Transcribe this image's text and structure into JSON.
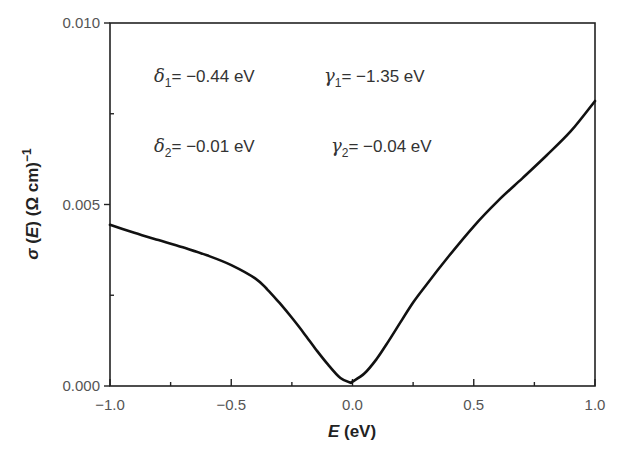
{
  "chart_data": {
    "type": "line",
    "title": "",
    "xlabel": "E (eV)",
    "ylabel": "σ (E) (Ω cm)⁻¹",
    "xlim": [
      -1.0,
      1.0
    ],
    "ylim": [
      0.0,
      0.01
    ],
    "x_ticks": [
      "-1.0",
      "-0.5",
      "0.0",
      "0.5",
      "1.0"
    ],
    "x_ticks_display": [
      "−1.0",
      "−0.5",
      "0.0",
      "0.5",
      "1.0"
    ],
    "y_ticks": [
      "0.000",
      "0.005",
      "0.010"
    ],
    "grid": false,
    "legend": null,
    "series": [
      {
        "name": "sigma(E)",
        "color": "#111111",
        "x": [
          -1.0,
          -0.9,
          -0.8,
          -0.7,
          -0.6,
          -0.5,
          -0.4,
          -0.35,
          -0.3,
          -0.25,
          -0.2,
          -0.15,
          -0.1,
          -0.05,
          -0.01,
          0.0,
          0.05,
          0.1,
          0.15,
          0.2,
          0.25,
          0.3,
          0.4,
          0.5,
          0.6,
          0.7,
          0.8,
          0.9,
          1.0
        ],
        "y": [
          0.00444,
          0.00422,
          0.00402,
          0.00382,
          0.0036,
          0.00333,
          0.00296,
          0.00265,
          0.00228,
          0.00188,
          0.00145,
          0.001,
          0.00058,
          0.00022,
          0.0001,
          0.00012,
          0.00035,
          0.00075,
          0.00125,
          0.00178,
          0.0023,
          0.00275,
          0.0036,
          0.0044,
          0.0051,
          0.00572,
          0.00635,
          0.00702,
          0.00785
        ]
      }
    ],
    "annotations": [
      {
        "symbol": "δ",
        "subscript": "1",
        "text": "= −0.44 eV"
      },
      {
        "symbol": "γ",
        "subscript": "1",
        "text": "= −1.35 eV"
      },
      {
        "symbol": "δ",
        "subscript": "2",
        "text": "= −0.01 eV"
      },
      {
        "symbol": "γ",
        "subscript": "2",
        "text": "= −0.04 eV"
      }
    ]
  },
  "labels": {
    "xlabel_var": "E",
    "xlabel_unit": " (eV)",
    "ylabel_sigma": "σ",
    "ylabel_E": "E",
    "ylabel_unit": "(Ω cm)",
    "ylabel_exp": "−1"
  }
}
